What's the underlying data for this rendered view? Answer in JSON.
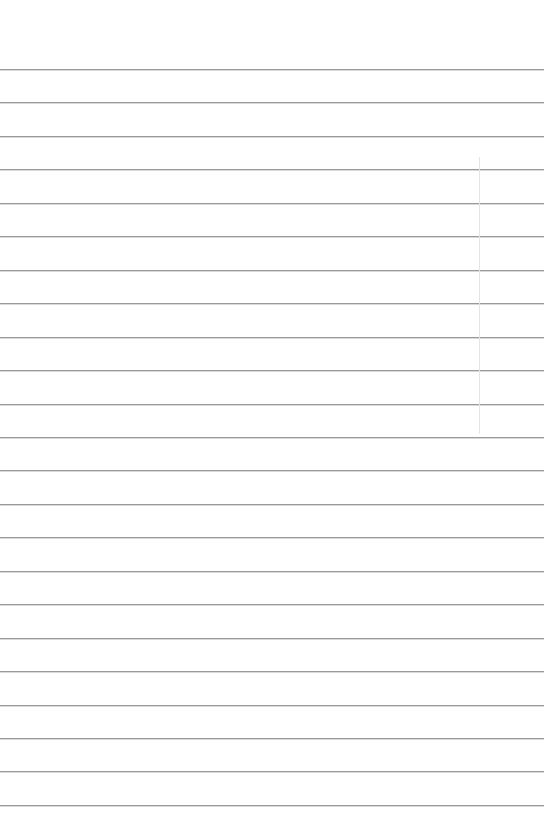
{
  "page": {
    "type": "lined-paper",
    "background_color": "#ffffff",
    "rule_color": "#9a9a9a",
    "rule_count": 23,
    "first_rule_y": 69,
    "rule_spacing": 33.45,
    "vertical_line": {
      "x": 479,
      "y_start": 157,
      "y_end": 434,
      "color": "#e4e4e4"
    }
  }
}
